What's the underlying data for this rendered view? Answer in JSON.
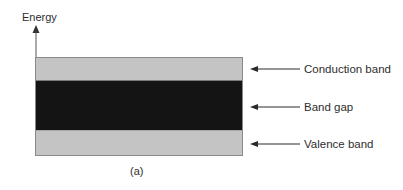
{
  "diagram": {
    "axis_label": "Energy",
    "caption": "(a)",
    "bands": [
      {
        "id": "conduction",
        "label": "Conduction band",
        "fill": "#c4c4c4"
      },
      {
        "id": "gap",
        "label": "Band gap",
        "fill": "#141414"
      },
      {
        "id": "valence",
        "label": "Valence band",
        "fill": "#c4c4c4"
      }
    ],
    "colors": {
      "border": "#8a8a8a",
      "arrow": "#2a2a2a",
      "axis": "#555555"
    }
  }
}
